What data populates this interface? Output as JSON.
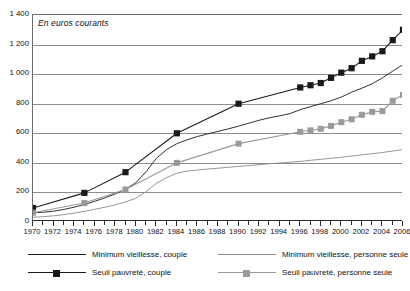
{
  "chart_data": {
    "type": "line",
    "title": "",
    "subtitle": "En euros courants",
    "xlabel": "",
    "ylabel": "",
    "xlim": [
      1970,
      2006
    ],
    "ylim": [
      0,
      1400
    ],
    "ytick_step": 200,
    "yticks": [
      0,
      200,
      400,
      600,
      800,
      1000,
      1200,
      1400
    ],
    "ytick_labels": [
      "0",
      "200",
      "400",
      "600",
      "800",
      "1 000",
      "1 200",
      "1 400"
    ],
    "xticks": [
      1970,
      1972,
      1974,
      1976,
      1978,
      1980,
      1982,
      1984,
      1986,
      1988,
      1990,
      1992,
      1994,
      1996,
      1998,
      2000,
      2002,
      2004,
      2006
    ],
    "xtick_labels": [
      "1970",
      "1972",
      "1974",
      "1976",
      "1978",
      "1980",
      "1982",
      "1984",
      "1986",
      "1988",
      "1990",
      "1992",
      "1994",
      "1996",
      "1998",
      "2000",
      "2002",
      "2004",
      "2006"
    ],
    "xtick_minor_step": 1,
    "grid": true,
    "grid_axis": "y",
    "legend_position": "below",
    "colors": {
      "minimum_vieillesse_couple": "#1a1a1a",
      "minimum_vieillesse_personne_seule": "#8a8a8a",
      "seuil_pauvrete_couple": "#1a1a1a",
      "seuil_pauvrete_personne_seule": "#9a9a9a"
    },
    "series": [
      {
        "name": "Minimum vieillesse, couple",
        "key": "minimum_vieillesse_couple",
        "style": "line",
        "color": "#1a1a1a",
        "marker": "none",
        "x": [
          1970,
          1971,
          1972,
          1973,
          1974,
          1975,
          1976,
          1977,
          1978,
          1979,
          1980,
          1981,
          1982,
          1983,
          1984,
          1985,
          1986,
          1987,
          1988,
          1989,
          1990,
          1991,
          1992,
          1993,
          1994,
          1995,
          1996,
          1997,
          1998,
          1999,
          2000,
          2001,
          2002,
          2003,
          2004,
          2005,
          2006
        ],
        "values": [
          62,
          66,
          73,
          85,
          100,
          118,
          140,
          163,
          190,
          222,
          265,
          340,
          430,
          490,
          530,
          556,
          578,
          596,
          613,
          630,
          648,
          668,
          688,
          705,
          718,
          733,
          760,
          780,
          800,
          820,
          845,
          878,
          905,
          935,
          975,
          1020,
          1065
        ]
      },
      {
        "name": "Minimum vieillesse, personne seule",
        "key": "minimum_vieillesse_personne_seule",
        "style": "line",
        "color": "#8a8a8a",
        "marker": "none",
        "x": [
          1970,
          1971,
          1972,
          1973,
          1974,
          1975,
          1976,
          1977,
          1978,
          1979,
          1980,
          1981,
          1982,
          1983,
          1984,
          1985,
          1986,
          1987,
          1988,
          1989,
          1990,
          1991,
          1992,
          1993,
          1994,
          1995,
          1996,
          1997,
          1998,
          1999,
          2000,
          2001,
          2002,
          2003,
          2004,
          2005,
          2006
        ],
        "values": [
          32,
          36,
          42,
          50,
          60,
          72,
          86,
          100,
          116,
          136,
          160,
          205,
          262,
          300,
          330,
          344,
          352,
          358,
          364,
          370,
          376,
          382,
          388,
          394,
          399,
          404,
          410,
          417,
          424,
          431,
          438,
          446,
          454,
          462,
          470,
          480,
          490
        ]
      },
      {
        "name": "Seuil pauvreté, couple",
        "key": "seuil_pauvrete_couple",
        "style": "marker-line",
        "color": "#1a1a1a",
        "marker": "square-dark",
        "x": [
          1970,
          1975,
          1979,
          1984,
          1990,
          1996,
          1997,
          1998,
          1999,
          2000,
          2001,
          2002,
          2003,
          2004,
          2005,
          2006
        ],
        "values": [
          95,
          197,
          337,
          600,
          800,
          910,
          925,
          940,
          975,
          1010,
          1040,
          1090,
          1120,
          1155,
          1230,
          1300
        ]
      },
      {
        "name": "Seuil pauvreté, personne seule",
        "key": "seuil_pauvrete_personne_seule",
        "style": "marker-line",
        "color": "#9a9a9a",
        "marker": "square-gray",
        "x": [
          1970,
          1975,
          1979,
          1984,
          1990,
          1996,
          1997,
          1998,
          1999,
          2000,
          2001,
          2002,
          2003,
          2004,
          2005,
          2006
        ],
        "values": [
          63,
          128,
          220,
          400,
          530,
          610,
          620,
          630,
          650,
          675,
          695,
          725,
          745,
          750,
          820,
          860
        ]
      }
    ],
    "legend": [
      {
        "label": "Minimum vieillesse, couple",
        "key": "minimum_vieillesse_couple",
        "marker": "none",
        "color": "#1a1a1a",
        "col": 0,
        "row": 0
      },
      {
        "label": "Seuil pauvreté, couple",
        "key": "seuil_pauvrete_couple",
        "marker": "square-dark",
        "color": "#1a1a1a",
        "col": 0,
        "row": 1
      },
      {
        "label": "Minimum vieillesse, personne seule",
        "key": "minimum_vieillesse_personne_seule",
        "marker": "none",
        "color": "#8a8a8a",
        "col": 1,
        "row": 0
      },
      {
        "label": "Seuil pauvreté, personne seule",
        "key": "seuil_pauvrete_personne_seule",
        "marker": "square-gray",
        "color": "#9a9a9a",
        "col": 1,
        "row": 1
      }
    ]
  }
}
